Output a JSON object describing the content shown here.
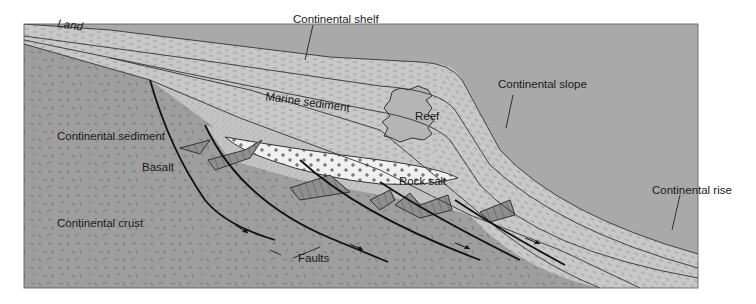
{
  "figure": {
    "type": "geological cross-section"
  },
  "labels": {
    "land": "Land",
    "continental_shelf": "Continental shelf",
    "continental_slope": "Continental slope",
    "continental_rise": "Continental rise",
    "marine_sediment": "Marine sediment",
    "reef": "Reef",
    "continental_sediment": "Continental sediment",
    "basalt": "Basalt",
    "rock_salt": "Rock salt",
    "continental_crust": "Continental crust",
    "faults": "Faults"
  },
  "colors": {
    "ocean": "#a9a9a9",
    "crust": "#9e9e9e",
    "marine_sediment": "#c6c6c6",
    "continental_sediment": "#c2c2c2",
    "reef": "#b3b3b3",
    "rock_salt": "#efefef",
    "basalt": "#8f8f8f",
    "background": "#ffffff"
  }
}
